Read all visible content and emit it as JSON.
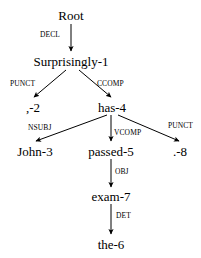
{
  "diagram": {
    "type": "dependency-tree",
    "sentence": "Surprisingly , John has passed the exam .",
    "background_color": "#ffffff",
    "line_color": "#000000",
    "text_color": "#000000",
    "nodes": [
      {
        "id": "root",
        "label": "Root",
        "x": 71,
        "y": 15
      },
      {
        "id": "surprisingly1",
        "label": "Surprisingly-1",
        "x": 71,
        "y": 61
      },
      {
        "id": "comma2",
        "label": ",-2",
        "x": 33,
        "y": 107
      },
      {
        "id": "has4",
        "label": "has-4",
        "x": 112,
        "y": 107
      },
      {
        "id": "john3",
        "label": "John-3",
        "x": 35,
        "y": 151
      },
      {
        "id": "passed5",
        "label": "passed-5",
        "x": 111,
        "y": 151
      },
      {
        "id": "period8",
        "label": ".-8",
        "x": 180,
        "y": 151
      },
      {
        "id": "exam7",
        "label": "exam-7",
        "x": 111,
        "y": 196
      },
      {
        "id": "the6",
        "label": "the-6",
        "x": 111,
        "y": 244
      }
    ],
    "edges": [
      {
        "id": "e-decl",
        "label": "DECL",
        "from": "root",
        "to": "surprisingly1",
        "x1": 71,
        "y1": 24,
        "x2": 71,
        "y2": 51,
        "label_x": 60,
        "label_y": 35,
        "label_anchor": "right"
      },
      {
        "id": "e-punct-1",
        "label": "PUNCT",
        "from": "surprisingly1",
        "to": "comma2",
        "x1": 66,
        "y1": 70,
        "x2": 34,
        "y2": 97,
        "label_x": 10,
        "label_y": 84,
        "label_anchor": "left"
      },
      {
        "id": "e-ccomp",
        "label": "CCOMP",
        "from": "surprisingly1",
        "to": "has4",
        "x1": 79,
        "y1": 70,
        "x2": 111,
        "y2": 97,
        "label_x": 97,
        "label_y": 84,
        "label_anchor": "left"
      },
      {
        "id": "e-nsubj",
        "label": "NSUBJ",
        "from": "has4",
        "to": "john3",
        "x1": 107,
        "y1": 115,
        "x2": 36,
        "y2": 141,
        "label_x": 28,
        "label_y": 128,
        "label_anchor": "left"
      },
      {
        "id": "e-vcomp",
        "label": "VCOMP",
        "from": "has4",
        "to": "passed5",
        "x1": 111,
        "y1": 115,
        "x2": 111,
        "y2": 141,
        "label_x": 114,
        "label_y": 133,
        "label_anchor": "left"
      },
      {
        "id": "e-punct-2",
        "label": "PUNCT",
        "from": "has4",
        "to": "period8",
        "x1": 118,
        "y1": 115,
        "x2": 179,
        "y2": 141,
        "label_x": 193,
        "label_y": 126,
        "label_anchor": "right"
      },
      {
        "id": "e-obj",
        "label": "OBJ",
        "from": "passed5",
        "to": "exam7",
        "x1": 111,
        "y1": 159,
        "x2": 111,
        "y2": 187,
        "label_x": 115,
        "label_y": 172,
        "label_anchor": "left"
      },
      {
        "id": "e-det",
        "label": "DET",
        "from": "exam7",
        "to": "the6",
        "x1": 111,
        "y1": 204,
        "x2": 111,
        "y2": 234,
        "label_x": 116,
        "label_y": 216,
        "label_anchor": "left"
      }
    ]
  }
}
